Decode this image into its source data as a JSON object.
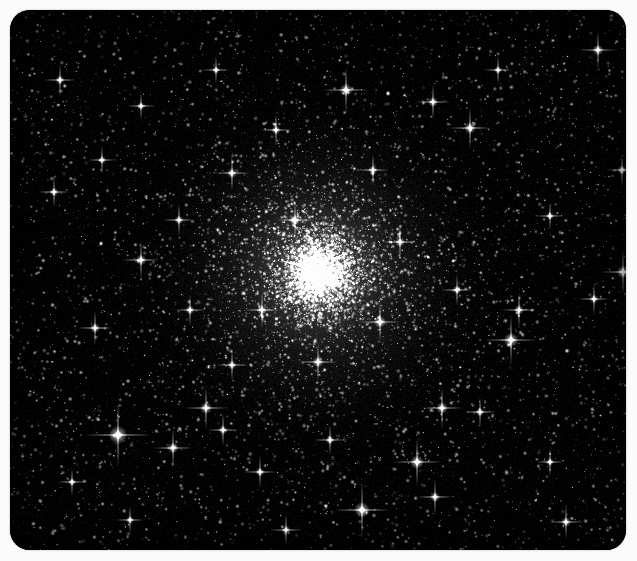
{
  "image": {
    "type": "astronomical-photograph",
    "subject": "globular star cluster",
    "color_mode": "grayscale",
    "caption": "",
    "width": 637,
    "height": 561
  },
  "frame": {
    "matte_color": "#fbfbfb",
    "panel_color": "#000000",
    "panel_x": 10,
    "panel_y": 10,
    "panel_width": 616,
    "panel_height": 540,
    "corner_radius": 20
  },
  "scene": {
    "background_color": "#000000",
    "star_color": "#ffffff",
    "core_glow_color": "#f2f2f2",
    "cluster_center_x": 308,
    "cluster_center_y": 262,
    "core_radius": 52,
    "halo_radius": 205,
    "field_star_count": 5200,
    "cluster_star_count": 9000,
    "bright_star_count": 46,
    "seed": 20240617
  },
  "bright_stars": [
    {
      "x": 108,
      "y": 425,
      "size": 19
    },
    {
      "x": 163,
      "y": 438,
      "size": 11
    },
    {
      "x": 196,
      "y": 398,
      "size": 12
    },
    {
      "x": 213,
      "y": 420,
      "size": 9
    },
    {
      "x": 352,
      "y": 500,
      "size": 16
    },
    {
      "x": 407,
      "y": 452,
      "size": 14
    },
    {
      "x": 425,
      "y": 487,
      "size": 10
    },
    {
      "x": 432,
      "y": 398,
      "size": 12
    },
    {
      "x": 501,
      "y": 330,
      "size": 15
    },
    {
      "x": 509,
      "y": 300,
      "size": 10
    },
    {
      "x": 584,
      "y": 289,
      "size": 9
    },
    {
      "x": 613,
      "y": 262,
      "size": 13
    },
    {
      "x": 588,
      "y": 40,
      "size": 11
    },
    {
      "x": 460,
      "y": 118,
      "size": 12
    },
    {
      "x": 423,
      "y": 92,
      "size": 10
    },
    {
      "x": 336,
      "y": 80,
      "size": 13
    },
    {
      "x": 266,
      "y": 120,
      "size": 9
    },
    {
      "x": 222,
      "y": 163,
      "size": 10
    },
    {
      "x": 169,
      "y": 210,
      "size": 9
    },
    {
      "x": 131,
      "y": 250,
      "size": 11
    },
    {
      "x": 85,
      "y": 318,
      "size": 10
    },
    {
      "x": 44,
      "y": 182,
      "size": 9
    },
    {
      "x": 50,
      "y": 70,
      "size": 9
    },
    {
      "x": 131,
      "y": 96,
      "size": 8
    },
    {
      "x": 308,
      "y": 352,
      "size": 11
    },
    {
      "x": 370,
      "y": 312,
      "size": 12
    },
    {
      "x": 252,
      "y": 300,
      "size": 10
    },
    {
      "x": 285,
      "y": 210,
      "size": 11
    },
    {
      "x": 390,
      "y": 232,
      "size": 10
    },
    {
      "x": 222,
      "y": 355,
      "size": 9
    },
    {
      "x": 470,
      "y": 402,
      "size": 9
    },
    {
      "x": 540,
      "y": 452,
      "size": 8
    },
    {
      "x": 556,
      "y": 512,
      "size": 10
    },
    {
      "x": 276,
      "y": 520,
      "size": 9
    },
    {
      "x": 120,
      "y": 510,
      "size": 8
    },
    {
      "x": 62,
      "y": 472,
      "size": 8
    },
    {
      "x": 612,
      "y": 160,
      "size": 9
    },
    {
      "x": 540,
      "y": 206,
      "size": 8
    },
    {
      "x": 488,
      "y": 60,
      "size": 8
    },
    {
      "x": 206,
      "y": 60,
      "size": 8
    },
    {
      "x": 92,
      "y": 150,
      "size": 8
    },
    {
      "x": 363,
      "y": 160,
      "size": 9
    },
    {
      "x": 447,
      "y": 280,
      "size": 9
    },
    {
      "x": 180,
      "y": 300,
      "size": 9
    },
    {
      "x": 320,
      "y": 430,
      "size": 9
    },
    {
      "x": 250,
      "y": 462,
      "size": 9
    }
  ],
  "labels": {
    "alt_text": "Dense globular star cluster with a bright concentrated core of unresolved starlight surrounded by thousands of resolved stars against a black sky."
  }
}
